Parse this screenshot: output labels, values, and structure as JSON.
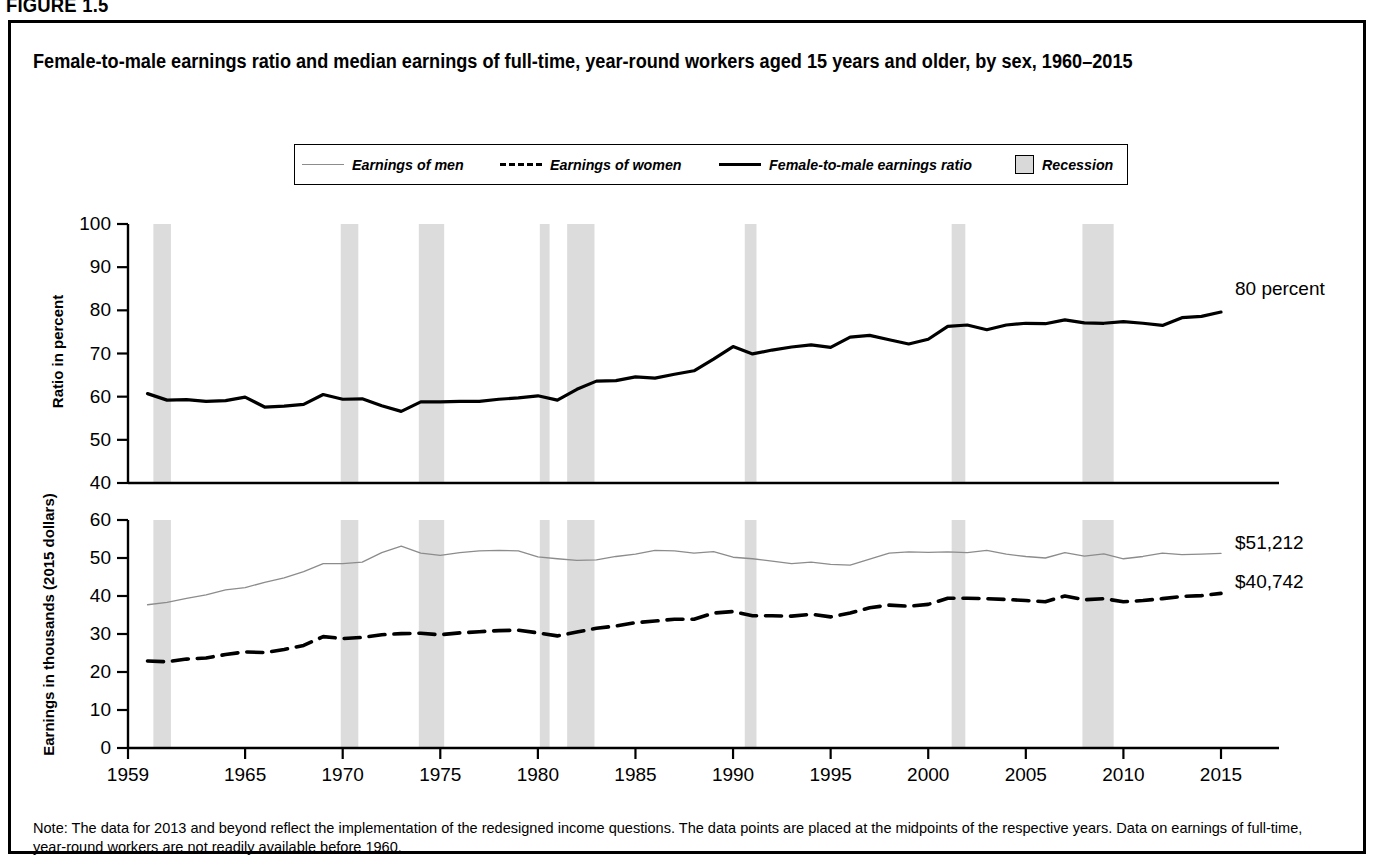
{
  "figure": {
    "label": "FIGURE 1.5"
  },
  "title": "Female-to-male earnings ratio and median earnings of full-time, year-round workers aged 15 years and older, by sex, 1960–2015",
  "legend": {
    "items": [
      {
        "label": "Earnings of men",
        "icon": "thin-gray-line-swatch",
        "color": "#8c8c8c"
      },
      {
        "label": "Earnings of women",
        "icon": "dashed-black-line-swatch",
        "color": "#000000"
      },
      {
        "label": "Female-to-male earnings ratio",
        "icon": "solid-black-line-swatch",
        "color": "#000000"
      },
      {
        "label": "Recession",
        "icon": "gray-box-swatch",
        "color": "#d9d9d9"
      }
    ]
  },
  "note": "Note: The data for 2013 and beyond reflect the implementation of the redesigned income questions. The data points are placed at the midpoints of the respective years. Data on earnings of full-time, year-round workers are not readily available before 1960.",
  "annotations": {
    "ratio_end": "80 percent",
    "men_end": "$51,212",
    "women_end": "$40,742"
  },
  "chart_data": {
    "type": "line",
    "title": "Female-to-male earnings ratio and median earnings of full-time, year-round workers aged 15 years and older, by sex, 1960–2015",
    "xlabel": "",
    "xlim": [
      1959,
      2015
    ],
    "xticks": [
      1959,
      1965,
      1970,
      1975,
      1980,
      1985,
      1990,
      1995,
      2000,
      2005,
      2010,
      2015
    ],
    "grid": false,
    "legend_position": "top-center",
    "panels": [
      {
        "name": "ratio-panel",
        "ylabel": "Ratio in percent",
        "ylim": [
          40,
          100
        ],
        "yticks": [
          40,
          50,
          60,
          70,
          80,
          90,
          100
        ],
        "series": [
          {
            "name": "Female-to-male earnings ratio",
            "style": "solid",
            "color": "#000000",
            "width": 3.2,
            "x": [
              1960,
              1961,
              1962,
              1963,
              1964,
              1965,
              1966,
              1967,
              1968,
              1969,
              1970,
              1971,
              1972,
              1973,
              1974,
              1975,
              1976,
              1977,
              1978,
              1979,
              1980,
              1981,
              1982,
              1983,
              1984,
              1985,
              1986,
              1987,
              1988,
              1989,
              1990,
              1991,
              1992,
              1993,
              1994,
              1995,
              1996,
              1997,
              1998,
              1999,
              2000,
              2001,
              2002,
              2003,
              2004,
              2005,
              2006,
              2007,
              2008,
              2009,
              2010,
              2011,
              2012,
              2013,
              2014,
              2015
            ],
            "values": [
              60.7,
              59.2,
              59.3,
              58.9,
              59.1,
              59.9,
              57.6,
              57.8,
              58.2,
              60.5,
              59.4,
              59.5,
              57.9,
              56.6,
              58.8,
              58.8,
              58.9,
              58.9,
              59.4,
              59.7,
              60.2,
              59.2,
              61.7,
              63.6,
              63.7,
              64.6,
              64.3,
              65.2,
              66.0,
              68.7,
              71.6,
              69.9,
              70.8,
              71.5,
              72.0,
              71.4,
              73.8,
              74.2,
              73.2,
              72.2,
              73.3,
              76.3,
              76.6,
              75.5,
              76.6,
              77.0,
              76.9,
              77.8,
              77.1,
              77.0,
              77.4,
              77.0,
              76.5,
              78.3,
              78.6,
              79.6
            ]
          }
        ],
        "annotation": {
          "text": "80 percent",
          "at_x": 2015,
          "at_y": 80
        }
      },
      {
        "name": "earnings-panel",
        "ylabel": "Earnings in thousands (2015 dollars)",
        "ylim": [
          0,
          60
        ],
        "yticks": [
          0,
          10,
          20,
          30,
          40,
          50,
          60
        ],
        "units": "thousands of 2015 dollars",
        "series": [
          {
            "name": "Earnings of men",
            "style": "solid",
            "color": "#8c8c8c",
            "width": 1.3,
            "x": [
              1960,
              1961,
              1962,
              1963,
              1964,
              1965,
              1966,
              1967,
              1968,
              1969,
              1970,
              1971,
              1972,
              1973,
              1974,
              1975,
              1976,
              1977,
              1978,
              1979,
              1980,
              1981,
              1982,
              1983,
              1984,
              1985,
              1986,
              1987,
              1988,
              1989,
              1990,
              1991,
              1992,
              1993,
              1994,
              1995,
              1996,
              1997,
              1998,
              1999,
              2000,
              2001,
              2002,
              2003,
              2004,
              2005,
              2006,
              2007,
              2008,
              2009,
              2010,
              2011,
              2012,
              2013,
              2014,
              2015
            ],
            "values": [
              37.7,
              38.3,
              39.4,
              40.3,
              41.6,
              42.2,
              43.6,
              44.8,
              46.4,
              48.5,
              48.5,
              48.9,
              51.4,
              53.1,
              51.3,
              50.7,
              51.4,
              51.9,
              52.0,
              51.9,
              50.3,
              49.8,
              49.4,
              49.5,
              50.4,
              51.0,
              52.0,
              51.9,
              51.3,
              51.7,
              50.2,
              49.8,
              49.2,
              48.5,
              48.9,
              48.3,
              48.1,
              49.7,
              51.3,
              51.6,
              51.5,
              51.6,
              51.4,
              52.0,
              51.0,
              50.4,
              50.0,
              51.4,
              50.5,
              51.1,
              49.8,
              50.4,
              51.3,
              50.9,
              51.0,
              51.2
            ]
          },
          {
            "name": "Earnings of women",
            "style": "dashed",
            "color": "#000000",
            "width": 3.6,
            "x": [
              1960,
              1961,
              1962,
              1963,
              1964,
              1965,
              1966,
              1967,
              1968,
              1969,
              1970,
              1971,
              1972,
              1973,
              1974,
              1975,
              1976,
              1977,
              1978,
              1979,
              1980,
              1981,
              1982,
              1983,
              1984,
              1985,
              1986,
              1987,
              1988,
              1989,
              1990,
              1991,
              1992,
              1993,
              1994,
              1995,
              1996,
              1997,
              1998,
              1999,
              2000,
              2001,
              2002,
              2003,
              2004,
              2005,
              2006,
              2007,
              2008,
              2009,
              2010,
              2011,
              2012,
              2013,
              2014,
              2015
            ],
            "values": [
              22.9,
              22.7,
              23.4,
              23.7,
              24.6,
              25.3,
              25.1,
              25.9,
              27.0,
              29.3,
              28.8,
              29.1,
              29.8,
              30.1,
              30.2,
              29.8,
              30.3,
              30.6,
              30.9,
              31.0,
              30.3,
              29.5,
              30.5,
              31.5,
              32.1,
              33.0,
              33.4,
              33.9,
              33.9,
              35.5,
              35.9,
              34.8,
              34.8,
              34.7,
              35.2,
              34.5,
              35.5,
              36.9,
              37.6,
              37.3,
              37.8,
              39.4,
              39.4,
              39.3,
              39.1,
              38.8,
              38.5,
              40.0,
              39.0,
              39.3,
              38.5,
              38.8,
              39.3,
              39.9,
              40.1,
              40.7
            ]
          }
        ],
        "annotations": [
          {
            "text": "$51,212",
            "at_x": 2015,
            "at_y": 51.2,
            "series": "Earnings of men"
          },
          {
            "text": "$40,742",
            "at_x": 2015,
            "at_y": 40.7,
            "series": "Earnings of women"
          }
        ]
      }
    ],
    "recessions": [
      {
        "start": 1960.3,
        "end": 1961.2
      },
      {
        "start": 1969.9,
        "end": 1970.8
      },
      {
        "start": 1973.9,
        "end": 1975.2
      },
      {
        "start": 1980.1,
        "end": 1980.6
      },
      {
        "start": 1981.5,
        "end": 1982.9
      },
      {
        "start": 1990.6,
        "end": 1991.2
      },
      {
        "start": 2001.2,
        "end": 2001.9
      },
      {
        "start": 2007.9,
        "end": 2009.5
      }
    ]
  }
}
